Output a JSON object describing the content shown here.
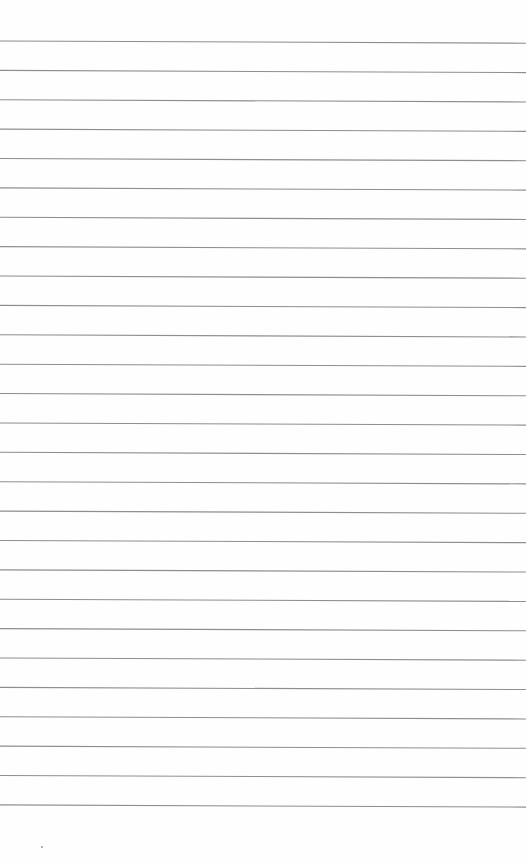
{
  "page": {
    "type": "blank-ruled-paper",
    "width": 528,
    "height": 864,
    "background_color": "#fefefe"
  },
  "rules": {
    "count": 27,
    "first_line_y_left": 41,
    "spacing": 29.38,
    "start_x": 0,
    "end_x": 526,
    "right_end_offset_y": 2.2,
    "line_color": "#8e8e8e",
    "line_width": 1.1
  },
  "specks": [
    {
      "x": 41,
      "y": 846
    }
  ]
}
